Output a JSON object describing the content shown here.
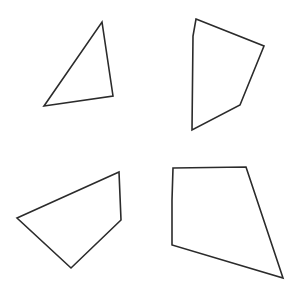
{
  "canvas": {
    "width": 299,
    "height": 298,
    "background_color": "#ffffff",
    "stroke_color": "#2b2b2b",
    "fill_color": "#ffffff",
    "stroke_width": 1.6,
    "description": "Four outlined polygons arranged in a two-by-two grid on a plain white background"
  },
  "shapes": [
    {
      "id": "shape-top-left",
      "name": "triangle",
      "sides": 3,
      "quadrant": "top-left",
      "points": "102,22 113,96 44,106",
      "vertices": [
        [
          102,
          22
        ],
        [
          113,
          96
        ],
        [
          44,
          106
        ]
      ]
    },
    {
      "id": "shape-top-right",
      "name": "pentagon",
      "sides": 5,
      "quadrant": "top-right",
      "points": "196,19 264,46 240,105 192,130 193,36",
      "vertices": [
        [
          196,
          19
        ],
        [
          264,
          46
        ],
        [
          240,
          105
        ],
        [
          192,
          130
        ],
        [
          193,
          36
        ]
      ]
    },
    {
      "id": "shape-bottom-left",
      "name": "quadrilateral",
      "sides": 4,
      "quadrant": "bottom-left",
      "points": "119,172 121,220 71,268 17,218",
      "vertices": [
        [
          119,
          172
        ],
        [
          121,
          220
        ],
        [
          71,
          268
        ],
        [
          17,
          218
        ]
      ]
    },
    {
      "id": "shape-bottom-right",
      "name": "pentagon",
      "sides": 5,
      "quadrant": "bottom-right",
      "points": "173,168 246,167 283,278 172,245 172,200",
      "vertices": [
        [
          173,
          168
        ],
        [
          246,
          167
        ],
        [
          283,
          278
        ],
        [
          172,
          245
        ],
        [
          172,
          200
        ]
      ]
    }
  ]
}
